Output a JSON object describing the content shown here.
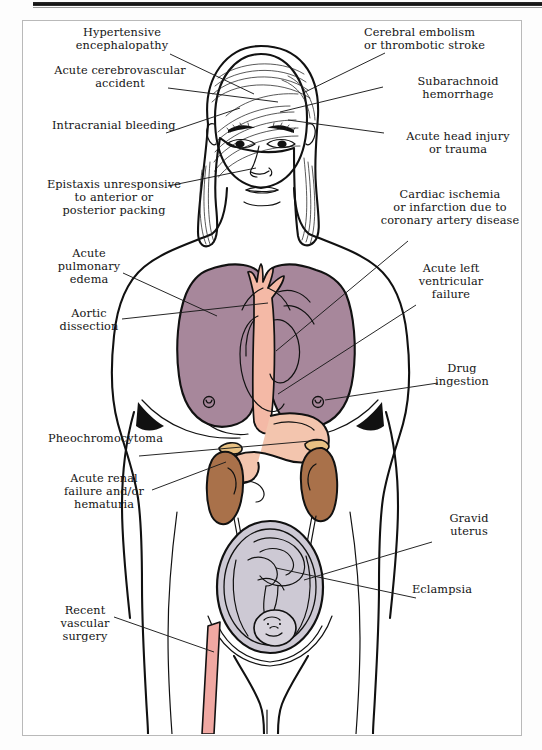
{
  "figure": {
    "type": "anatomical-diagram",
    "orientation": "anterior view",
    "frame": {
      "border_color": "#b9b9b9",
      "background": "#ffffff"
    }
  },
  "palette": {
    "outline": "#111111",
    "lung": "#a7879b",
    "lung_shadow": "#917288",
    "heart_aorta": "#f4b9a6",
    "vessel_pink": "#f0a8a2",
    "kidney": "#a9714a",
    "adrenal": "#e8c183",
    "stomach": "#f3c5ae",
    "uterus": "#cdc9d4",
    "fetus": "#d7d3dc",
    "skin": "#ffffff",
    "label_text": "#141414",
    "leader_line": "#1a1a1a"
  },
  "labels": {
    "left": [
      {
        "id": "hypertensive-encephalopathy",
        "text": "Hypertensive\nencephalopathy",
        "align": "center"
      },
      {
        "id": "acute-cerebrovascular-accident",
        "text": "Acute cerebrovascular\naccident",
        "align": "center"
      },
      {
        "id": "intracranial-bleeding",
        "text": "Intracranial bleeding",
        "align": "left"
      },
      {
        "id": "epistaxis",
        "text": "Epistaxis unresponsive\nto anterior or\nposterior packing",
        "align": "center"
      },
      {
        "id": "acute-pulmonary-edema",
        "text": "Acute\npulmonary\nedema",
        "align": "center"
      },
      {
        "id": "aortic-dissection",
        "text": "Aortic\ndissection",
        "align": "center"
      },
      {
        "id": "pheochromocytoma",
        "text": "Pheochromocytoma",
        "align": "left"
      },
      {
        "id": "acute-renal-failure",
        "text": "Acute renal\nfailure and/or\nhematuria",
        "align": "center"
      },
      {
        "id": "recent-vascular-surgery",
        "text": "Recent\nvascular\nsurgery",
        "align": "center"
      }
    ],
    "right": [
      {
        "id": "cerebral-embolism",
        "text": "Cerebral embolism\nor thrombotic stroke",
        "align": "left"
      },
      {
        "id": "subarachnoid-hemorrhage",
        "text": "Subarachnoid\nhemorrhage",
        "align": "center"
      },
      {
        "id": "acute-head-injury",
        "text": "Acute head injury\nor trauma",
        "align": "center"
      },
      {
        "id": "cardiac-ischemia",
        "text": "Cardiac ischemia\nor infarction due to\ncoronary artery disease",
        "align": "center"
      },
      {
        "id": "acute-left-ventricular-failure",
        "text": "Acute left\nventricular\nfailure",
        "align": "center"
      },
      {
        "id": "drug-ingestion",
        "text": "Drug\ningestion",
        "align": "center"
      },
      {
        "id": "gravid-uterus",
        "text": "Gravid\nuterus",
        "align": "center"
      },
      {
        "id": "eclampsia",
        "text": "Eclampsia",
        "align": "left"
      }
    ]
  }
}
